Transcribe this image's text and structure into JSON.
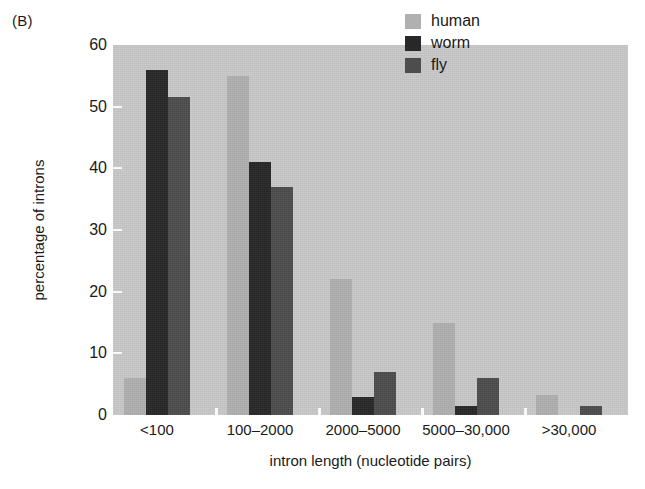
{
  "panel_label": "(B)",
  "chart_data": {
    "type": "bar",
    "title": "",
    "xlabel": "intron length (nucleotide pairs)",
    "ylabel": "percentage of introns",
    "categories": [
      "<100",
      "100–2000",
      "2000–5000",
      "5000–30,000",
      ">30,000"
    ],
    "series": [
      {
        "name": "human",
        "color": "#b0b0b0",
        "values": [
          6,
          55,
          22,
          15,
          3.2
        ]
      },
      {
        "name": "worm",
        "color": "#282828",
        "values": [
          56,
          41,
          3,
          1.5,
          0
        ]
      },
      {
        "name": "fly",
        "color": "#4d4d4d",
        "values": [
          51.5,
          37,
          7,
          6,
          1.4
        ]
      }
    ],
    "ylim": [
      0,
      60
    ],
    "yticks": [
      0,
      10,
      20,
      30,
      40,
      50,
      60
    ],
    "ytick_labels": [
      "0",
      "10",
      "20",
      "30",
      "40",
      "50",
      "60"
    ],
    "grid": false,
    "legend_position": "top-right",
    "plot_background": "#c9c9c9",
    "page_background": "#ffffff"
  },
  "legend": {
    "entries": [
      {
        "label": "human",
        "color": "#b0b0b0"
      },
      {
        "label": "worm",
        "color": "#282828"
      },
      {
        "label": "fly",
        "color": "#4d4d4d"
      }
    ]
  }
}
